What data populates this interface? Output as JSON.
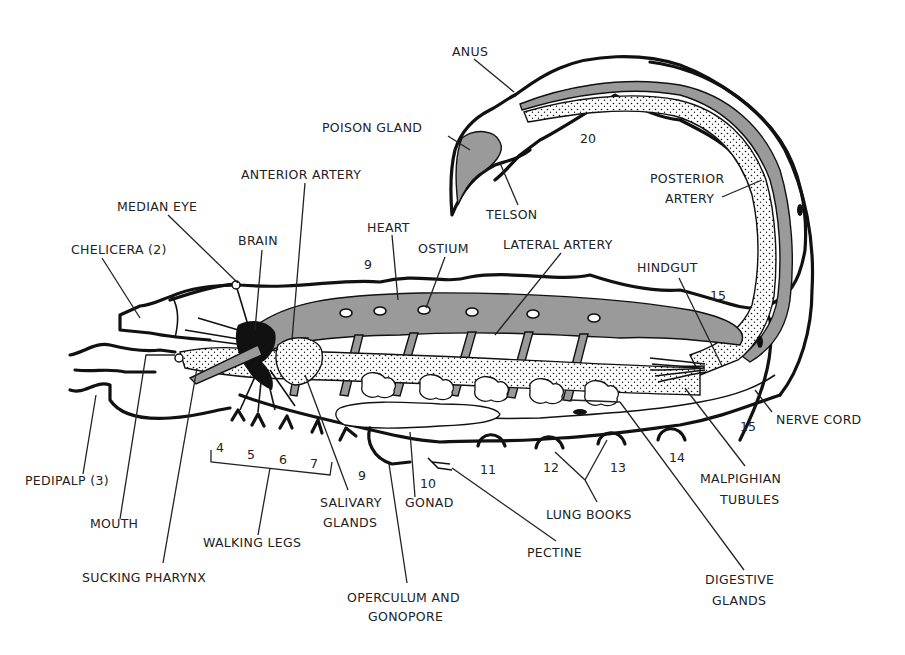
{
  "figure": {
    "colors": {
      "ink": "#111111",
      "shading": "#9a9a9a",
      "background": "#ffffff"
    }
  },
  "labels": {
    "anus": "ANUS",
    "poison_gland": "POISON GLAND",
    "telson": "TELSON",
    "anterior_artery": "ANTERIOR ARTERY",
    "median_eye": "MEDIAN EYE",
    "brain": "BRAIN",
    "chelicera": "CHELICERA (2)",
    "heart": "HEART",
    "ostium": "OSTIUM",
    "lateral_artery": "LATERAL ARTERY",
    "posterior_artery_1": "POSTERIOR",
    "posterior_artery_2": "ARTERY",
    "hindgut": "HINDGUT",
    "nerve_cord": "NERVE CORD",
    "pedipalp": "PEDIPALP (3)",
    "mouth": "MOUTH",
    "sucking_pharynx": "SUCKING PHARYNX",
    "walking_legs": "WALKING LEGS",
    "salivary_glands_1": "SALIVARY",
    "salivary_glands_2": "GLANDS",
    "gonad": "GONAD",
    "operculum_1": "OPERCULUM AND",
    "operculum_2": "GONOPORE",
    "pectine": "PECTINE",
    "lung_books": "LUNG BOOKS",
    "malpighian_1": "MALPIGHIAN",
    "malpighian_2": "TUBULES",
    "digestive_1": "DIGESTIVE",
    "digestive_2": "GLANDS"
  },
  "segment_numbers": {
    "seg_20": "20",
    "seg_9_top": "9",
    "seg_15_top": "15",
    "seg_15_bottom": "15",
    "leg_4": "4",
    "leg_5": "5",
    "leg_6": "6",
    "leg_7": "7",
    "seg_9_bottom": "9",
    "seg_10": "10",
    "seg_11": "11",
    "seg_12": "12",
    "seg_13": "13",
    "seg_14": "14"
  }
}
